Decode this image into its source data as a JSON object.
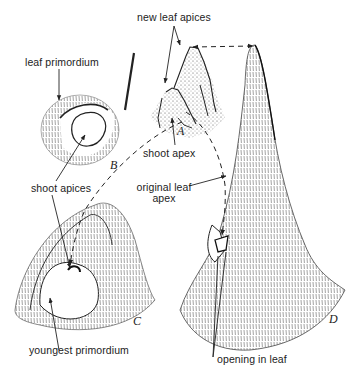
{
  "figure": {
    "panels": [
      {
        "id": "A",
        "letter": "A",
        "description": "shoot apex with new leaf apices (stippled)"
      },
      {
        "id": "B",
        "letter": "B",
        "description": "top view of leaf primordium around shoot apices"
      },
      {
        "id": "C",
        "letter": "C",
        "description": "young leaf with youngest primordium"
      },
      {
        "id": "D",
        "letter": "D",
        "description": "older leaf with opening"
      }
    ],
    "labels": {
      "new_leaf_apices": "new leaf apices",
      "leaf_primordium": "leaf primordium",
      "shoot_apex": "shoot apex",
      "shoot_apices": "shoot apices",
      "original_leaf_apex_line1": "original leaf",
      "original_leaf_apex_line2": "apex",
      "youngest_primordium": "youngest primordium",
      "opening_in_leaf": "opening in leaf"
    },
    "colors": {
      "ink": "#222222",
      "background": "#ffffff"
    }
  }
}
